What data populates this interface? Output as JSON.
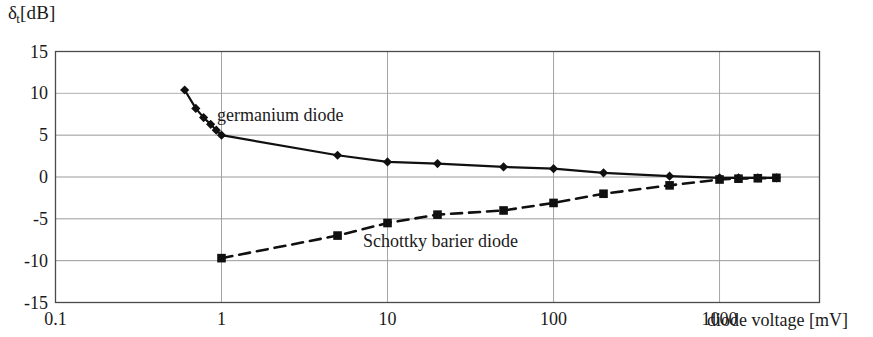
{
  "axes": {
    "y_axis_title": "δt[dB]",
    "y_axis_symbol": "δ",
    "y_axis_subscript": "t",
    "y_axis_unit": "[dB]",
    "x_axis_title": "diode voltage [mV]",
    "y_ticks": [
      "15",
      "10",
      "5",
      "0",
      "-5",
      "-10",
      "-15"
    ],
    "x_ticks": [
      "0.1",
      "1",
      "10",
      "100",
      "1000"
    ]
  },
  "labels": {
    "germanium": "germanium diode",
    "schottky": "Schottky barier diode"
  },
  "colors": {
    "line": "#101010",
    "grid": "#9a9a9a",
    "frame": "#4a4a4a",
    "background": "#ffffff"
  },
  "chart_data": {
    "type": "line",
    "title": "",
    "xlabel": "diode voltage [mV]",
    "ylabel": "δt[dB]",
    "xscale": "log",
    "xlim": [
      0.1,
      4000
    ],
    "ylim": [
      -15,
      15
    ],
    "yticks": [
      15,
      10,
      5,
      0,
      -5,
      -10,
      -15
    ],
    "xticks": [
      0.1,
      1,
      10,
      100,
      1000
    ],
    "grid": true,
    "legend": "inline-annotations",
    "series": [
      {
        "name": "germanium diode",
        "marker": "diamond",
        "linestyle": "solid",
        "x": [
          0.6,
          0.7,
          0.78,
          0.86,
          0.93,
          1.0,
          5.0,
          10.0,
          20.0,
          50.0,
          100.0,
          200.0,
          500.0,
          1000.0,
          1300.0,
          1700.0,
          2200.0
        ],
        "y": [
          10.4,
          8.2,
          7.1,
          6.3,
          5.6,
          5.0,
          2.6,
          1.8,
          1.6,
          1.2,
          1.0,
          0.5,
          0.1,
          -0.1,
          -0.1,
          -0.1,
          -0.1
        ]
      },
      {
        "name": "Schottky barier diode",
        "marker": "square",
        "linestyle": "dashed",
        "x": [
          1.0,
          5.0,
          10.0,
          20.0,
          50.0,
          100.0,
          200.0,
          500.0,
          1000.0,
          1300.0,
          1700.0,
          2200.0
        ],
        "y": [
          -9.7,
          -7.0,
          -5.5,
          -4.5,
          -4.0,
          -3.1,
          -2.0,
          -1.0,
          -0.3,
          -0.2,
          -0.15,
          -0.1
        ]
      }
    ]
  }
}
